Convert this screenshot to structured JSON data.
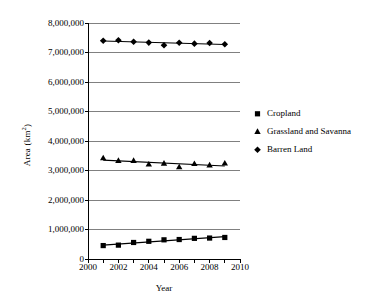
{
  "chart_data": {
    "type": "line",
    "title": "",
    "xlabel": "Year",
    "ylabel": "Area (km2)",
    "ylabel_html": "Area (km<sup>2</sup>)",
    "ylabel_unit_base": "Area (km",
    "ylabel_unit_sup": "2",
    "ylabel_unit_tail": ")",
    "x": [
      2001,
      2002,
      2003,
      2004,
      2005,
      2006,
      2007,
      2008,
      2009
    ],
    "xlim": [
      2000,
      2010
    ],
    "ylim": [
      0,
      8000000
    ],
    "xticks": [
      2000,
      2001,
      2002,
      2003,
      2004,
      2005,
      2006,
      2007,
      2008,
      2009,
      2010
    ],
    "xtick_labels": [
      "2000",
      "",
      "2002",
      "",
      "2004",
      "",
      "2006",
      "",
      "2008",
      "",
      "2010"
    ],
    "xtick_labels_shown": [
      "2000",
      "2002",
      "2004",
      "2006",
      "2008",
      "2010"
    ],
    "yticks": [
      0,
      1000000,
      2000000,
      3000000,
      4000000,
      5000000,
      6000000,
      7000000,
      8000000
    ],
    "ytick_labels": [
      "0",
      "1,000,000",
      "2,000,000",
      "3,000,000",
      "4,000,000",
      "5,000,000",
      "6,000,000",
      "7,000,000",
      "8,000,000"
    ],
    "grid": "horizontal",
    "grid_color": "#808080",
    "legend_position": "right",
    "series": [
      {
        "name": "Cropland",
        "marker": "square",
        "color": "#000000",
        "values": [
          455000,
          470000,
          560000,
          600000,
          650000,
          660000,
          700000,
          710000,
          730000
        ]
      },
      {
        "name": "Grassland and Savanna",
        "marker": "triangle",
        "color": "#000000",
        "values": [
          3420000,
          3330000,
          3330000,
          3205000,
          3235000,
          3115000,
          3225000,
          3175000,
          3240000
        ]
      },
      {
        "name": "Barren Land",
        "marker": "diamond",
        "color": "#000000",
        "values": [
          7400000,
          7415000,
          7365000,
          7335000,
          7245000,
          7330000,
          7300000,
          7320000,
          7280000
        ]
      }
    ]
  },
  "legend": {
    "items": [
      {
        "label": "Cropland",
        "marker": "square"
      },
      {
        "label": "Grassland and Savanna",
        "marker": "triangle"
      },
      {
        "label": "Barren Land",
        "marker": "diamond"
      }
    ]
  }
}
